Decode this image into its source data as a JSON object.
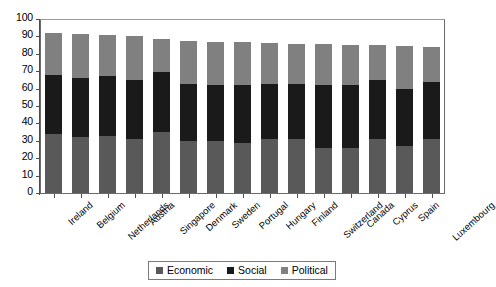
{
  "chart_data": {
    "type": "bar",
    "stacked": true,
    "title": "",
    "subtitle": "",
    "xlabel": "",
    "ylabel": "",
    "ylim": [
      0,
      100
    ],
    "ytick_step": 10,
    "yticks": [
      100,
      90,
      80,
      70,
      60,
      50,
      40,
      30,
      20,
      10,
      0
    ],
    "grid": false,
    "legend_position": "bottom-center",
    "categories": [
      "Ireland",
      "Belgium",
      "Netherlands",
      "Austria",
      "Singapore",
      "Denmark",
      "Sweden",
      "Portugal",
      "Hungary",
      "Finland",
      "Switzerland",
      "Canada",
      "Cyprus",
      "Spain",
      "Luxembourg"
    ],
    "series": [
      {
        "name": "Economic",
        "color": "#595959",
        "values": [
          34,
          32,
          33,
          31,
          35,
          30,
          30,
          29,
          31,
          31,
          26,
          26,
          31,
          27,
          31
        ]
      },
      {
        "name": "Social",
        "color": "#1a1a1a",
        "values": [
          34,
          34,
          34,
          34,
          34.5,
          32.5,
          32,
          33,
          31.5,
          31.5,
          36,
          36,
          34,
          33,
          33
        ]
      },
      {
        "name": "Political",
        "color": "#808080",
        "values": [
          24,
          25.5,
          24,
          25.5,
          19,
          25,
          25,
          25,
          23.5,
          23,
          23.5,
          23,
          20,
          24.5,
          20
        ]
      }
    ],
    "totals": [
      92,
      91.5,
      91,
      90.5,
      88.5,
      87.5,
      87,
      87,
      86,
      85.5,
      85.5,
      85,
      85,
      84.5,
      84
    ]
  },
  "legend": {
    "items": [
      {
        "label": "Economic",
        "color": "#595959"
      },
      {
        "label": "Social",
        "color": "#1a1a1a"
      },
      {
        "label": "Political",
        "color": "#808080"
      }
    ]
  },
  "colors": {
    "economic": "#595959",
    "social": "#1a1a1a",
    "political": "#808080",
    "axis": "#4d4d4d",
    "frame": "#6b6b6b",
    "background": "#ffffff"
  }
}
